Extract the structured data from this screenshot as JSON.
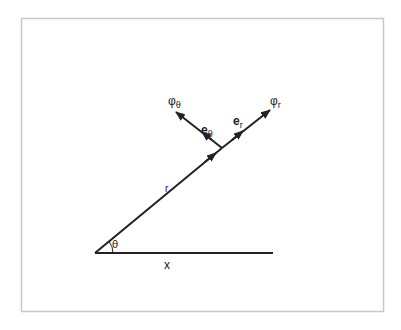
{
  "diagram": {
    "labels": {
      "phi_theta": "φ",
      "phi_theta_sub": "θ",
      "phi_r": "φ",
      "phi_r_sub": "r",
      "e_theta": "e",
      "e_theta_sub": "θ",
      "e_r": "e",
      "e_r_sub": "r",
      "r": "r",
      "theta": "θ",
      "x": "x"
    },
    "colors": {
      "line": "#222222",
      "frame": "#c8c8c8",
      "background": "#ffffff"
    }
  }
}
